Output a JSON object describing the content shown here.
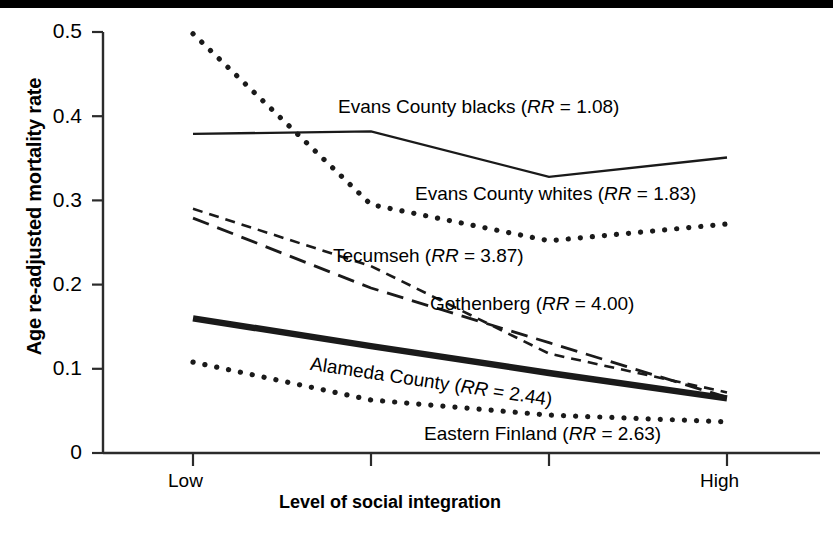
{
  "chart_data": {
    "type": "line",
    "title": "",
    "xlabel": "Level of social integration",
    "ylabel": "Age re-adjusted mortality rate",
    "ylim": [
      0,
      0.5
    ],
    "yticks": [
      "0",
      "0.1",
      "0.2",
      "0.3",
      "0.4",
      "0.5"
    ],
    "ytick_values": [
      0,
      0.1,
      0.2,
      0.3,
      0.4,
      0.5
    ],
    "xticks": [
      "Low",
      "",
      "",
      "High"
    ],
    "xtick_labels_visible": [
      "Low",
      "High"
    ],
    "x": [
      1,
      2,
      3,
      4
    ],
    "grid": false,
    "legend": "inline-annotations",
    "series": [
      {
        "name": "Evans County blacks",
        "rr": "1.08",
        "label": "Evans County blacks (RR = 1.08)",
        "style": "solid",
        "values": [
          0.379,
          0.382,
          0.328,
          0.351
        ]
      },
      {
        "name": "Evans County whites",
        "rr": "1.83",
        "label": "Evans County whites (RR = 1.83)",
        "style": "dotted",
        "values": [
          0.498,
          0.295,
          0.252,
          0.272
        ]
      },
      {
        "name": "Tecumseh",
        "rr": "3.87",
        "label": "Tecumseh (RR =  3.87)",
        "style": "short-dash",
        "values": [
          0.29,
          0.222,
          0.118,
          0.072
        ]
      },
      {
        "name": "Gothenberg",
        "rr": "4.00",
        "label": "Gothenberg (RR = 4.00)",
        "style": "long-dash",
        "values": [
          0.279,
          0.196,
          0.131,
          0.066
        ]
      },
      {
        "name": "Alameda County",
        "rr": "2.44",
        "label": "Alameda County (RR = 2.44)",
        "style": "thick-solid",
        "values": [
          0.16,
          0.127,
          0.095,
          0.065
        ]
      },
      {
        "name": "Eastern Finland",
        "rr": "2.63",
        "label": "Eastern Finland (RR = 2.63)",
        "style": "dotted",
        "values": [
          0.108,
          0.063,
          0.045,
          0.037
        ]
      }
    ],
    "annotations": [
      {
        "id": "evans-blacks",
        "text_before": "Evans County blacks (",
        "em": "RR",
        "text_after": " = 1.08)"
      },
      {
        "id": "evans-whites",
        "text_before": "Evans County whites (",
        "em": "RR",
        "text_after": " = 1.83)"
      },
      {
        "id": "tecumseh",
        "text_before": "Tecumseh (",
        "em": "RR",
        "text_after": " =  3.87)"
      },
      {
        "id": "gothenberg",
        "text_before": "Gothenberg (",
        "em": "RR",
        "text_after": " = 4.00)"
      },
      {
        "id": "alameda",
        "text_before": "Alameda County (",
        "em": "RR",
        "text_after": " = 2.44)"
      },
      {
        "id": "eastern-finland",
        "text_before": "Eastern Finland (",
        "em": "RR",
        "text_after": " = 2.63)"
      }
    ],
    "colors": {
      "line": "#1a1a1a",
      "axis": "#2b2b2b",
      "text": "#000000",
      "background": "#ffffff",
      "band": "#000000"
    }
  },
  "axes": {
    "y_title": "Age re-adjusted mortality rate",
    "x_title": "Level of social integration",
    "y_tick_0": "0",
    "y_tick_1": "0.1",
    "y_tick_2": "0.2",
    "y_tick_3": "0.3",
    "y_tick_4": "0.4",
    "y_tick_5": "0.5",
    "x_tick_low": "Low",
    "x_tick_high": "High"
  }
}
